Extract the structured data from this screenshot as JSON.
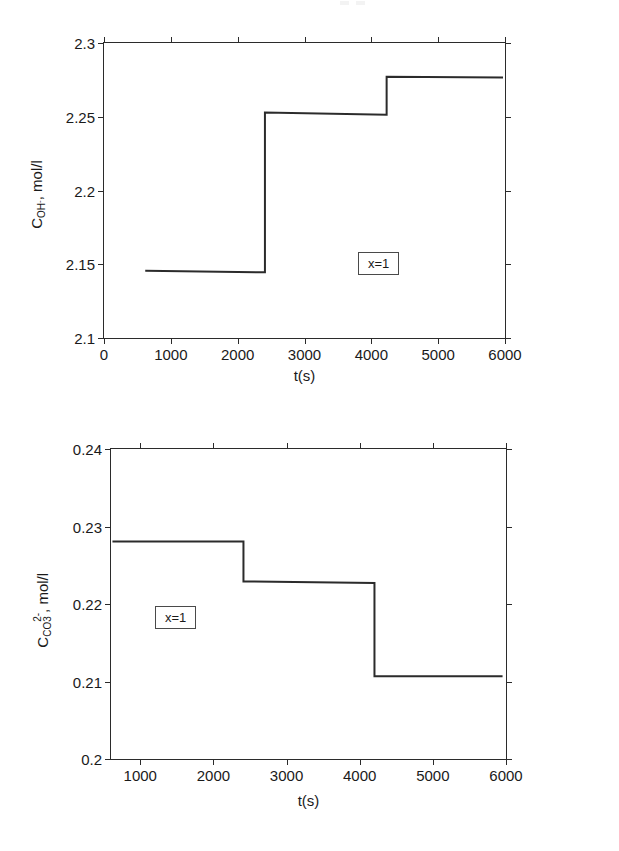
{
  "figure": {
    "background": "#ffffff",
    "line_color": "#2b2b2b",
    "axis_color": "#2b2b2b"
  },
  "chart_data": [
    {
      "id": "top",
      "type": "line",
      "style": "step",
      "title": "",
      "xlabel": "t(s)",
      "ylabel": "C_OH-, mol/l",
      "ylabel_parts": {
        "base": "C",
        "sub": "OH",
        "sub_charge": "-",
        "unit": ", mol/l"
      },
      "xlim": [
        0,
        6000
      ],
      "ylim": [
        2.1,
        2.3
      ],
      "xticks": [
        0,
        1000,
        2000,
        3000,
        4000,
        5000,
        6000
      ],
      "xticklabels": [
        "0",
        "1000",
        "2000",
        "3000",
        "4000",
        "5000",
        "6000"
      ],
      "yticks": [
        2.1,
        2.15,
        2.2,
        2.25,
        2.3
      ],
      "yticklabels": [
        "2.1",
        "2.15",
        "2.2",
        "2.25",
        "2.3"
      ],
      "grid": false,
      "legend": null,
      "annotations": [
        {
          "text": "x=1",
          "x": 3350,
          "y": 2.164,
          "boxed": true
        }
      ],
      "x": [
        620,
        2420,
        2420,
        4250,
        4250,
        6000
      ],
      "y": [
        2.1445,
        2.1435,
        2.2525,
        2.251,
        2.277,
        2.2765
      ],
      "segments": [
        {
          "x_start": 620,
          "x_end": 2420,
          "y_start": 2.1445,
          "y_end": 2.1435
        },
        {
          "x_start": 2420,
          "x_end": 4250,
          "y_start": 2.2525,
          "y_end": 2.251
        },
        {
          "x_start": 4250,
          "x_end": 6000,
          "y_start": 2.277,
          "y_end": 2.2765
        }
      ]
    },
    {
      "id": "bottom",
      "type": "line",
      "style": "step",
      "title": "",
      "xlabel": "t(s)",
      "ylabel": "C_CO3 2-, mol/l",
      "ylabel_parts": {
        "base": "C",
        "sub": "CO",
        "sup_charge": "2-",
        "sub_index": "3",
        "unit": ", mol/l"
      },
      "xlim": [
        600,
        6000
      ],
      "ylim": [
        0.2,
        0.24
      ],
      "xticks": [
        1000,
        2000,
        3000,
        4000,
        5000,
        6000
      ],
      "xticklabels": [
        "1000",
        "2000",
        "3000",
        "4000",
        "5000",
        "6000"
      ],
      "yticks": [
        0.2,
        0.21,
        0.22,
        0.23,
        0.24
      ],
      "yticklabels": [
        "0.2",
        "0.21",
        "0.22",
        "0.23",
        "0.24"
      ],
      "grid": false,
      "legend": null,
      "annotations": [
        {
          "text": "x=1",
          "x": 1700,
          "y": 0.2112,
          "boxed": true
        }
      ],
      "x": [
        620,
        2420,
        2420,
        4220,
        4220,
        5980
      ],
      "y": [
        0.228,
        0.228,
        0.2228,
        0.2226,
        0.2105,
        0.2105
      ],
      "segments": [
        {
          "x_start": 620,
          "x_end": 2420,
          "y_start": 0.228,
          "y_end": 0.228
        },
        {
          "x_start": 2420,
          "x_end": 4220,
          "y_start": 0.2228,
          "y_end": 0.2226
        },
        {
          "x_start": 4220,
          "x_end": 5980,
          "y_start": 0.2105,
          "y_end": 0.2105
        }
      ]
    }
  ]
}
